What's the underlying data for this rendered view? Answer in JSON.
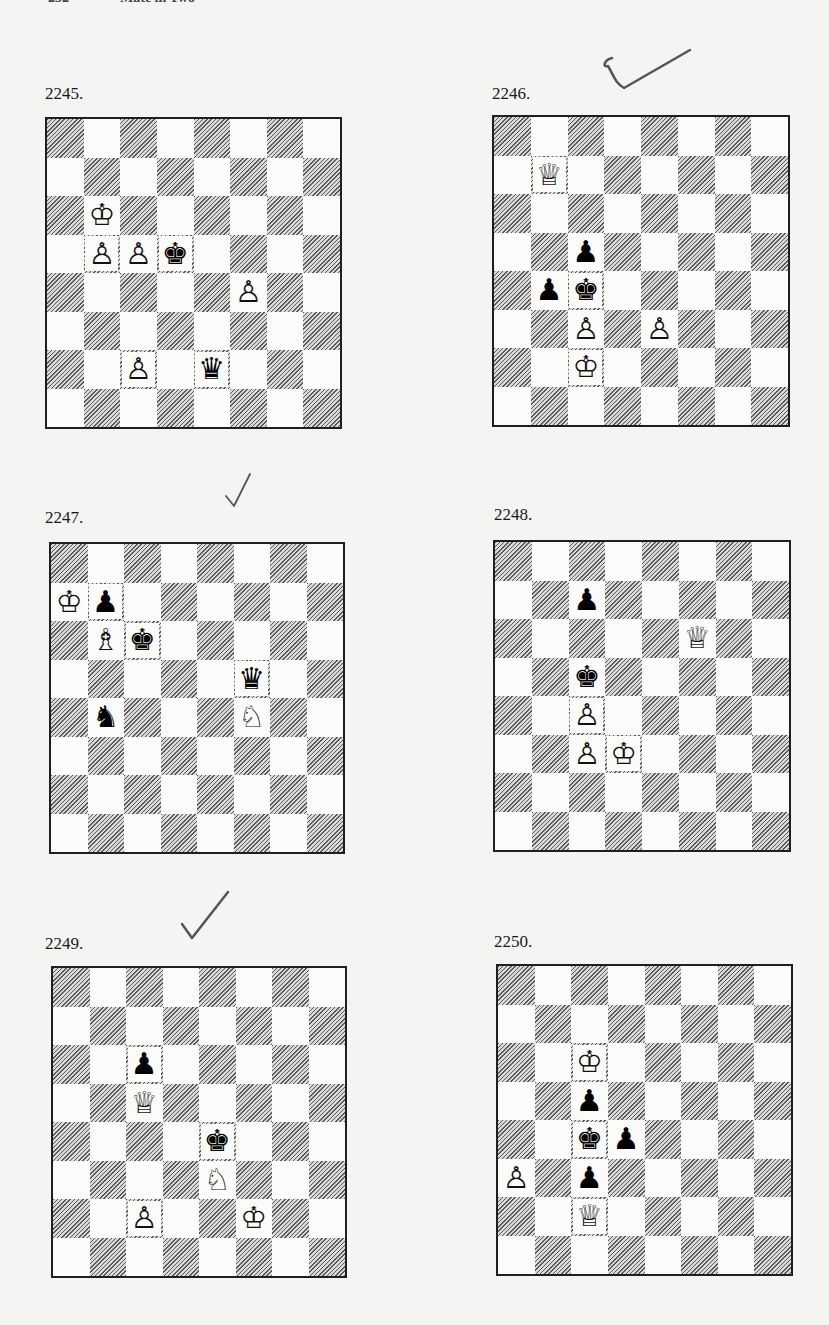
{
  "page": {
    "header_partial": [
      "232",
      "Mate in Two"
    ]
  },
  "piece_glyphs": {
    "white": {
      "K": "♔",
      "Q": "♕",
      "R": "♖",
      "B": "♗",
      "N": "♘",
      "P": "♙"
    },
    "black": {
      "K": "♚",
      "Q": "♛",
      "R": "♜",
      "B": "♝",
      "N": "♞",
      "P": "♟"
    }
  },
  "diagrams": [
    {
      "number": "2245.",
      "checkmark": false,
      "white": [
        "Kb6",
        "Pb5",
        "Pc5",
        "Pf4",
        "Pc2"
      ],
      "black": [
        "Kd5",
        "Qe2"
      ]
    },
    {
      "number": "2246.",
      "checkmark": true,
      "checkmark_style": "hook",
      "white": [
        "Qb7",
        "Pc3",
        "Pe3",
        "Kc2"
      ],
      "black": [
        "Pc5",
        "Pb4",
        "Kc4"
      ]
    },
    {
      "number": "2247.",
      "checkmark": true,
      "checkmark_style": "faint",
      "white": [
        "Ka7",
        "Bb6",
        "Nf4"
      ],
      "black": [
        "Pb7",
        "Kc6",
        "Qf5",
        "Nb4"
      ]
    },
    {
      "number": "2248.",
      "checkmark": false,
      "white": [
        "Qf6",
        "Pc4",
        "Pc3",
        "Kd3"
      ],
      "black": [
        "Pc7",
        "Kc5"
      ]
    },
    {
      "number": "2249.",
      "checkmark": true,
      "checkmark_style": "bold",
      "white": [
        "Qc5",
        "Ne3",
        "Pc2",
        "Kf2"
      ],
      "black": [
        "Pc6",
        "Ke4"
      ]
    },
    {
      "number": "2250.",
      "checkmark": false,
      "white": [
        "Kc6",
        "Pa3",
        "Qc2"
      ],
      "black": [
        "Pc5",
        "Kc4",
        "Pd4",
        "Pc3"
      ]
    }
  ]
}
